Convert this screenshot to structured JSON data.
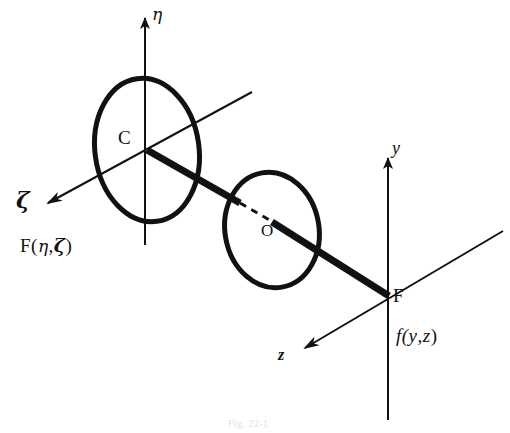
{
  "figure": {
    "caption": "Fig. 22-1",
    "background_color": "#ffffff",
    "ink_color": "#111111"
  },
  "labels": {
    "eta_axis": "η",
    "zeta_axis": "ζ",
    "y_axis": "y",
    "z_axis": "z",
    "point_c": "C",
    "point_o": "O",
    "point_f": "F",
    "object_function_f_open": "F(",
    "object_function_eta": "η",
    "object_function_comma": ",",
    "object_function_zeta": "ζ",
    "object_function_close": ")",
    "image_function_f_open": "f(",
    "image_function_y": "y",
    "image_function_comma": ",",
    "image_function_z": "z",
    "image_function_close": ")"
  },
  "geometry": {
    "left_ellipse": {
      "center_x": 147,
      "center_y": 150,
      "radius_x": 52,
      "radius_y": 72,
      "rotation_deg": -8,
      "stroke_width": 5
    },
    "middle_ellipse": {
      "center_x": 272,
      "center_y": 230,
      "radius_x": 47,
      "radius_y": 58,
      "rotation_deg": -10,
      "stroke_width": 5
    },
    "eta_axis": {
      "x1": 145,
      "y1": 245,
      "x2": 145,
      "y2": 18,
      "stroke_width": 2,
      "arrow": "end"
    },
    "zeta_axis": {
      "x1": 252,
      "y1": 92,
      "x2": 45,
      "y2": 204,
      "stroke_width": 2,
      "arrow": "end"
    },
    "y_axis": {
      "x1": 388,
      "y1": 420,
      "x2": 388,
      "y2": 156,
      "stroke_width": 2,
      "arrow": "end"
    },
    "z_axis": {
      "x1": 503,
      "y1": 231,
      "x2": 302,
      "y2": 350,
      "stroke_width": 2,
      "arrow": "end"
    },
    "principal_ray_upper": {
      "x1": 147,
      "y1": 150,
      "x2": 238,
      "y2": 202,
      "stroke_width": 7
    },
    "principal_ray_dashed": {
      "x1": 238,
      "y1": 202,
      "x2": 276,
      "y2": 224,
      "stroke_width": 3,
      "dash": "7 6"
    },
    "principal_ray_lower": {
      "x1": 272,
      "y1": 222,
      "x2": 388,
      "y2": 296,
      "stroke_width": 7
    }
  },
  "label_positions": {
    "eta": {
      "x": 152,
      "y": 6
    },
    "zeta": {
      "x": 16,
      "y": 190
    },
    "y": {
      "x": 392,
      "y": 140
    },
    "z": {
      "x": 278,
      "y": 345
    },
    "c": {
      "x": 118,
      "y": 130
    },
    "o": {
      "x": 262,
      "y": 224
    },
    "f": {
      "x": 394,
      "y": 288
    },
    "object_function": {
      "x": 20,
      "y": 236
    },
    "image_function": {
      "x": 396,
      "y": 326
    },
    "caption": {
      "x": 228,
      "y": 418
    }
  }
}
